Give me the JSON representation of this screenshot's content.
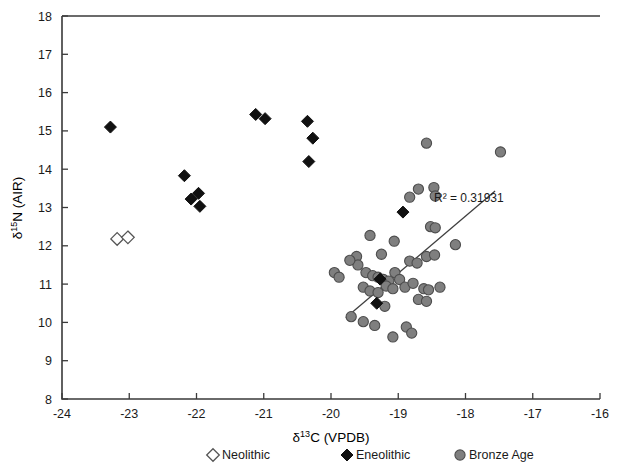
{
  "chart_data": {
    "type": "scatter",
    "title": "",
    "xlabel": "δ¹³C (VPDB)",
    "ylabel": "δ¹⁵N (AIR)",
    "xlabel_parts": {
      "delta": "δ",
      "sup": "13",
      "rest": "C (VPDB)"
    },
    "ylabel_parts": {
      "delta": "δ",
      "sup": "15",
      "rest": "N (AIR)"
    },
    "xlim": [
      -24,
      -16
    ],
    "ylim": [
      8,
      18
    ],
    "xticks": [
      -24,
      -23,
      -22,
      -21,
      -20,
      -19,
      -18,
      -17,
      -16
    ],
    "xtick_labels": [
      "-24",
      "-23",
      "-22",
      "-21",
      "-20",
      "-19",
      "-18",
      "-17",
      "-16"
    ],
    "yticks": [
      8,
      9,
      10,
      11,
      12,
      13,
      14,
      15,
      16,
      17,
      18
    ],
    "ytick_labels": [
      "8",
      "9",
      "10",
      "11",
      "12",
      "13",
      "14",
      "15",
      "16",
      "17",
      "18"
    ],
    "grid": false,
    "legend_position": "bottom",
    "annotations": [
      {
        "text": "R² = 0.31931",
        "x": -17.95,
        "y": 13.15
      }
    ],
    "trendline": {
      "label": "R² = 0.31931",
      "r_squared": 0.31931,
      "x_start": -19.78,
      "y_start": 10.12,
      "x_end": -17.56,
      "y_end": 13.43
    },
    "series": [
      {
        "name": "Neolithic",
        "marker": "open-diamond",
        "color": "#ffffff",
        "edge_color": "#555555",
        "points": [
          [
            -23.18,
            12.18
          ],
          [
            -23.02,
            12.22
          ]
        ]
      },
      {
        "name": "Eneolithic",
        "marker": "filled-diamond",
        "color": "#111111",
        "edge_color": "#111111",
        "points": [
          [
            -23.28,
            15.1
          ],
          [
            -22.18,
            13.83
          ],
          [
            -22.08,
            13.22
          ],
          [
            -21.97,
            13.37
          ],
          [
            -21.95,
            13.03
          ],
          [
            -21.12,
            15.43
          ],
          [
            -20.98,
            15.32
          ],
          [
            -20.35,
            15.25
          ],
          [
            -20.27,
            14.81
          ],
          [
            -20.33,
            14.2
          ],
          [
            -18.93,
            12.88
          ],
          [
            -19.27,
            11.13
          ],
          [
            -19.32,
            10.5
          ]
        ]
      },
      {
        "name": "Bronze Age",
        "marker": "filled-circle",
        "color": "#7f7f7f",
        "edge_color": "#4d4d4d",
        "points": [
          [
            -19.95,
            11.3
          ],
          [
            -18.58,
            14.68
          ],
          [
            -17.48,
            14.45
          ],
          [
            -18.7,
            13.48
          ],
          [
            -18.47,
            13.52
          ],
          [
            -18.45,
            13.3
          ],
          [
            -18.83,
            13.27
          ],
          [
            -18.52,
            12.5
          ],
          [
            -18.45,
            12.47
          ],
          [
            -18.15,
            12.03
          ],
          [
            -19.42,
            12.27
          ],
          [
            -19.06,
            12.12
          ],
          [
            -19.25,
            11.78
          ],
          [
            -19.62,
            11.72
          ],
          [
            -19.6,
            11.5
          ],
          [
            -19.72,
            11.62
          ],
          [
            -18.58,
            11.72
          ],
          [
            -18.46,
            11.76
          ],
          [
            -18.83,
            11.6
          ],
          [
            -18.72,
            11.55
          ],
          [
            -19.48,
            11.3
          ],
          [
            -19.38,
            11.22
          ],
          [
            -19.3,
            11.18
          ],
          [
            -19.22,
            11.12
          ],
          [
            -19.14,
            11.08
          ],
          [
            -19.05,
            11.3
          ],
          [
            -18.98,
            11.12
          ],
          [
            -19.18,
            10.95
          ],
          [
            -19.08,
            10.88
          ],
          [
            -18.9,
            10.92
          ],
          [
            -18.78,
            11.02
          ],
          [
            -18.62,
            10.88
          ],
          [
            -18.55,
            10.85
          ],
          [
            -18.38,
            10.92
          ],
          [
            -19.88,
            11.18
          ],
          [
            -19.52,
            10.92
          ],
          [
            -19.42,
            10.82
          ],
          [
            -19.3,
            10.78
          ],
          [
            -19.2,
            10.42
          ],
          [
            -18.7,
            10.6
          ],
          [
            -18.58,
            10.55
          ],
          [
            -19.7,
            10.15
          ],
          [
            -19.52,
            10.02
          ],
          [
            -19.35,
            9.92
          ],
          [
            -18.88,
            9.88
          ],
          [
            -18.8,
            9.72
          ],
          [
            -19.08,
            9.62
          ]
        ]
      }
    ]
  },
  "legend": {
    "items": [
      {
        "label": "Neolithic",
        "marker": "open-diamond"
      },
      {
        "label": "Eneolithic",
        "marker": "filled-diamond"
      },
      {
        "label": "Bronze Age",
        "marker": "filled-circle"
      }
    ]
  },
  "colors": {
    "bronze_fill": "#7f7f7f",
    "bronze_edge": "#4d4d4d",
    "eneolithic": "#111111",
    "neolithic_edge": "#555555",
    "axis": "#3a3a3a",
    "trendline": "#3f3f3f",
    "background": "#ffffff"
  }
}
